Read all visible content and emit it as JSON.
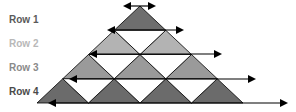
{
  "rows": [
    {
      "label": "Row 1",
      "label_color": "#5a5a5a",
      "label_y": 22,
      "fill": "#6e6e6e"
    },
    {
      "label": "Row 2",
      "label_color": "#b8b8b8",
      "label_y": 46,
      "fill": "#b3b3b3"
    },
    {
      "label": "Row 3",
      "label_color": "#8a8a8a",
      "label_y": 70,
      "fill": "#9a9a9a"
    },
    {
      "label": "Row 4",
      "label_color": "#4a4a4a",
      "label_y": 94,
      "fill": "#6b6b6b"
    }
  ],
  "geometry": {
    "apex_x": 140,
    "apex_y": 6,
    "base_y": 103,
    "half_width": 103,
    "row_count": 4
  },
  "arrows": [
    {
      "y": 6,
      "x1": 123,
      "x2": 156
    },
    {
      "y": 30,
      "x1": 107,
      "x2": 184
    },
    {
      "y": 54,
      "x1": 89,
      "x2": 222
    },
    {
      "y": 79,
      "x1": 69,
      "x2": 256
    },
    {
      "y": 103,
      "x1": 48,
      "x2": 288
    }
  ],
  "colors": {
    "line": "#000000",
    "blank": "#ffffff"
  }
}
